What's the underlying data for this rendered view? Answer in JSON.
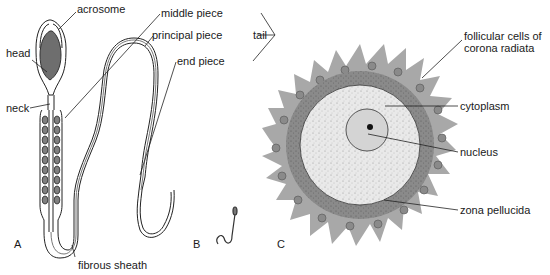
{
  "figure": {
    "panels": [
      {
        "id": "A",
        "label": "A",
        "subject": "spermatozoon (detailed)"
      },
      {
        "id": "B",
        "label": "B",
        "subject": "spermatozoon (scale)"
      },
      {
        "id": "C",
        "label": "C",
        "subject": "ovum (secondary oocyte)"
      }
    ],
    "sperm_labels": {
      "acrosome": "acrosome",
      "head": "head",
      "neck": "neck",
      "middle_piece": "middle piece",
      "principal_piece": "principal piece",
      "end_piece": "end piece",
      "tail": "tail",
      "fibrous_sheath": "fibrous sheath"
    },
    "ovum_labels": {
      "follicular_cells_line1": "follicular cells of",
      "follicular_cells_line2": "corona radiata",
      "cytoplasm": "cytoplasm",
      "nucleus": "nucleus",
      "zona_pellucida": "zona pellucida"
    },
    "colors": {
      "line": "#222222",
      "head_fill": "#6e6e6e",
      "mito_fill": "#808080",
      "corona_fill": "#a8a8a8",
      "zona_fill": "#8f8f8f",
      "cytoplasm_fill": "#e6e6e6",
      "nucleus_fill": "#d2d2d2"
    }
  }
}
